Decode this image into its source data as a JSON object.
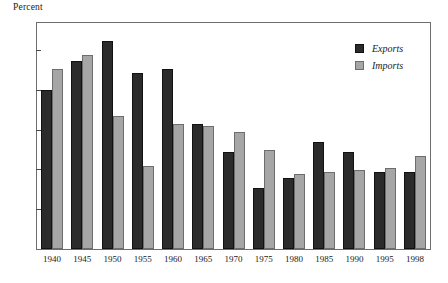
{
  "chart_data": {
    "type": "bar",
    "title": "",
    "ylabel": "Percent",
    "xlabel": "",
    "ylim": [
      0,
      57
    ],
    "yticks": [
      10,
      20,
      30,
      40,
      50
    ],
    "grid": false,
    "legend_position": "top-right",
    "categories": [
      "1940",
      "1945",
      "1950",
      "1955",
      "1960",
      "1965",
      "1970",
      "1975",
      "1980",
      "1985",
      "1990",
      "1995",
      "1998"
    ],
    "series": [
      {
        "name": "Exports",
        "color": "#2b2b2b",
        "values": [
          40,
          47.5,
          52.5,
          44.5,
          45.5,
          31.5,
          24.5,
          15.5,
          18,
          27,
          24.5,
          19.5,
          19.5
        ]
      },
      {
        "name": "Imports",
        "color": "#a6a6a6",
        "values": [
          45.5,
          49,
          33.5,
          21,
          31.5,
          31,
          29.5,
          25,
          19,
          19.5,
          20,
          20.5,
          23.5
        ]
      }
    ]
  },
  "axis": {
    "unit_title": "Percent"
  },
  "legend": {
    "items": [
      {
        "label": "Exports",
        "swatch": "exports"
      },
      {
        "label": "Imports",
        "swatch": "imports"
      }
    ]
  }
}
